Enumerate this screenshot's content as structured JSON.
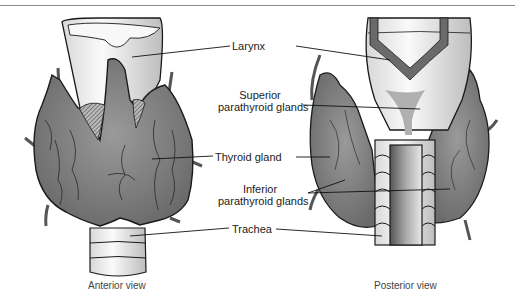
{
  "figure": {
    "labels": {
      "larynx": "Larynx",
      "superior_1": "Superior",
      "superior_2": "parathyroid glands",
      "thyroid": "Thyroid gland",
      "inferior_1": "Inferior",
      "inferior_2": "parathyroid glands",
      "trachea": "Trachea"
    },
    "captions": {
      "anterior": "Anterior view",
      "posterior": "Posterior view"
    },
    "colors": {
      "gland": "#7d7d7d",
      "cartilage": "#f0f0f0",
      "outline": "#1a1a1a"
    }
  }
}
